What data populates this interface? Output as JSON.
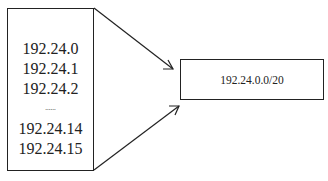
{
  "left_box": {
    "entries": [
      "192.24.0",
      "192.24.1",
      "192.24.2",
      "......",
      "192.24.14",
      "192.24.15"
    ]
  },
  "right_box": {
    "label": "192.24.0.0/20"
  },
  "arrows": [
    {
      "from": "left-box-top-right",
      "to": "right-box"
    },
    {
      "from": "left-box-bottom-right",
      "to": "right-box"
    }
  ]
}
